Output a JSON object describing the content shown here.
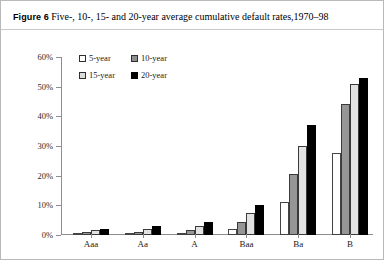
{
  "figure": {
    "label": "Figure 6",
    "caption": "Five-, 10-, 15- and 20-year average cumulative default rates,1970–98"
  },
  "chart_data": {
    "type": "bar",
    "title": "Five-, 10-, 15- and 20-year average cumulative default rates,1970–98",
    "xlabel": "",
    "ylabel": "",
    "categories": [
      "Aaa",
      "Aa",
      "A",
      "Baa",
      "Ba",
      "B"
    ],
    "series": [
      {
        "name": "5-year",
        "color": "#ffffff",
        "values": [
          0.2,
          0.5,
          0.8,
          2.0,
          11.0,
          27.5
        ]
      },
      {
        "name": "10-year",
        "color": "#969696",
        "values": [
          0.9,
          1.1,
          1.6,
          4.5,
          20.5,
          44.0
        ]
      },
      {
        "name": "15-year",
        "color": "#e2e2e2",
        "values": [
          1.6,
          2.0,
          3.0,
          7.5,
          30.0,
          51.0
        ]
      },
      {
        "name": "20-year",
        "color": "#000000",
        "values": [
          2.1,
          2.9,
          4.5,
          10.0,
          37.0,
          53.0
        ]
      }
    ],
    "ylim": [
      0,
      60
    ],
    "yticks": [
      "0%",
      "10%",
      "20%",
      "30%",
      "40%",
      "50%",
      "60%"
    ],
    "ytick_values": [
      0,
      10,
      20,
      30,
      40,
      50,
      60
    ],
    "grid": false,
    "legend_position": "top-left",
    "value_suffix": "%"
  }
}
